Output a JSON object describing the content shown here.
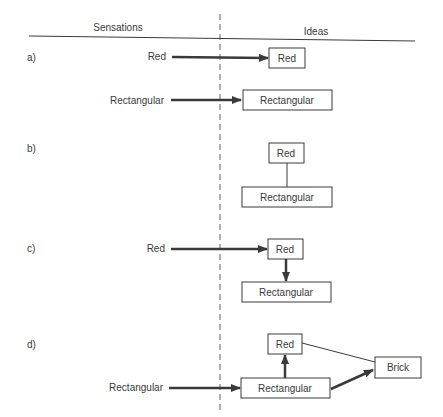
{
  "header": {
    "left_column": "Sensations",
    "right_column": "Ideas"
  },
  "panels": {
    "a": {
      "label": "a)",
      "sensations": [
        "Red",
        "Rectangular"
      ],
      "ideas": [
        "Red",
        "Rectangular"
      ],
      "description": "Each sensation produces a separate idea"
    },
    "b": {
      "label": "b)",
      "ideas": [
        "Red",
        "Rectangular"
      ],
      "description": "Ideas Red and Rectangular are associated"
    },
    "c": {
      "label": "c)",
      "sensations": [
        "Red"
      ],
      "ideas": [
        "Red",
        "Rectangular"
      ],
      "description": "Sensation Red evokes idea Red, which evokes Rectangular"
    },
    "d": {
      "label": "d)",
      "sensations": [
        "Rectangular"
      ],
      "ideas": [
        "Red",
        "Rectangular",
        "Brick"
      ],
      "description": "Sensation Rectangular evokes Rectangular, which evokes Red and Brick"
    }
  },
  "colors": {
    "ink": "#3a3a3a",
    "background": "#ffffff"
  }
}
